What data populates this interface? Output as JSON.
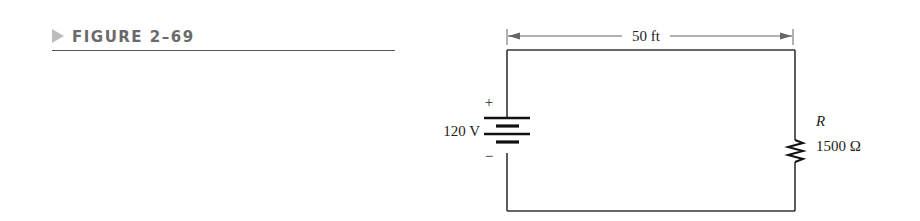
{
  "figure": {
    "caption": "FIGURE 2–69"
  },
  "circuit": {
    "dimension_label": "50 ft",
    "source": {
      "voltage_label": "120 V",
      "positive_label": "+",
      "negative_label": "−"
    },
    "resistor": {
      "name_label": "R",
      "value_label": "1500 Ω"
    },
    "colors": {
      "wire": "#333333",
      "dimension": "#666666",
      "caption": "#6a6a6a",
      "caption_marker": "#bdbdbd"
    }
  }
}
